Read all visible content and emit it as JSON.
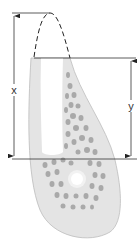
{
  "diagram": {
    "type": "anatomical-cross-section",
    "labels": {
      "x": "x",
      "y": "y"
    },
    "measurements": [
      {
        "name": "x",
        "from": "top of dashed outline",
        "to": "base line"
      },
      {
        "name": "y",
        "from": "socket crest line",
        "to": "base line"
      }
    ],
    "colors": {
      "bone_fill": "#e2e2e2",
      "bone_outline": "#b8b8b8",
      "trabecular": "#a8a8a8",
      "lines": "#333333",
      "socket": "#ffffff"
    }
  }
}
